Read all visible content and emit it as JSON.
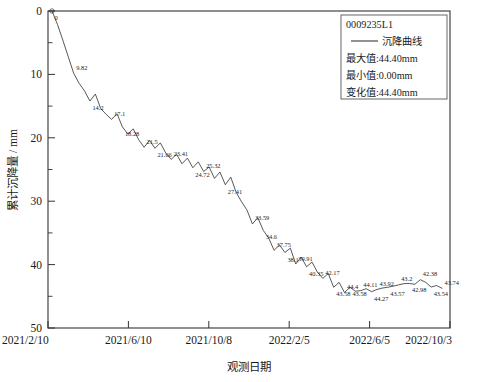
{
  "chart_data": {
    "type": "line",
    "title": "",
    "xlabel": "观测日期",
    "ylabel": "累计沉降量 / mm",
    "y_inverted": true,
    "ylim": [
      0,
      50
    ],
    "y_ticks": [
      "0",
      "10",
      "20",
      "30",
      "40",
      "50"
    ],
    "y_tick_values": [
      0,
      10,
      20,
      30,
      40,
      50
    ],
    "x_ticks": [
      "2021/2/10",
      "2021/6/10",
      "2021/10/8",
      "2022/2/5",
      "2022/6/5",
      "2022/10/3"
    ],
    "grid": false,
    "legend_position": "top-right",
    "series": [
      {
        "name": "沉降曲线",
        "point_labels": [
          "0",
          "9.82",
          "14.2",
          "17.1",
          "18.28",
          "21.5",
          "21.66",
          "23.41",
          "24.72",
          "25.32",
          "27.41",
          "33.59",
          "34.6",
          "37.75",
          "38.1",
          "39.91",
          "40.35",
          "42.17",
          "43.58",
          "44.4",
          "43.58",
          "44.11",
          "44.27",
          "43.92",
          "43.57",
          "43.2",
          "42.98",
          "42.38",
          "43.54",
          "43.74"
        ],
        "values": [
          0.0,
          2.1,
          4.6,
          7.2,
          9.82,
          11.4,
          12.6,
          14.2,
          13.1,
          15.4,
          16.3,
          17.1,
          16.2,
          18.28,
          19.4,
          18.6,
          20.3,
          21.5,
          20.4,
          21.66,
          20.8,
          22.4,
          23.41,
          22.6,
          24.1,
          23.2,
          24.72,
          23.8,
          25.32,
          24.6,
          26.4,
          25.4,
          27.41,
          26.2,
          28.6,
          30.1,
          31.4,
          33.59,
          32.6,
          34.6,
          35.8,
          37.75,
          36.9,
          38.1,
          37.4,
          39.91,
          38.8,
          40.35,
          39.6,
          41.2,
          42.17,
          41.4,
          43.58,
          42.8,
          44.4,
          43.58,
          44.2,
          44.11,
          43.8,
          44.27,
          43.92,
          43.7,
          43.57,
          43.4,
          43.2,
          43.0,
          42.98,
          43.1,
          42.38,
          42.8,
          43.54,
          43.3,
          43.74
        ]
      }
    ]
  },
  "legend": {
    "id": "0009235L1",
    "series_label": "沉降曲线",
    "max_label": "最大值:44.40mm",
    "min_label": "最小值:0.00mm",
    "change_label": "变化值:44.40mm"
  }
}
